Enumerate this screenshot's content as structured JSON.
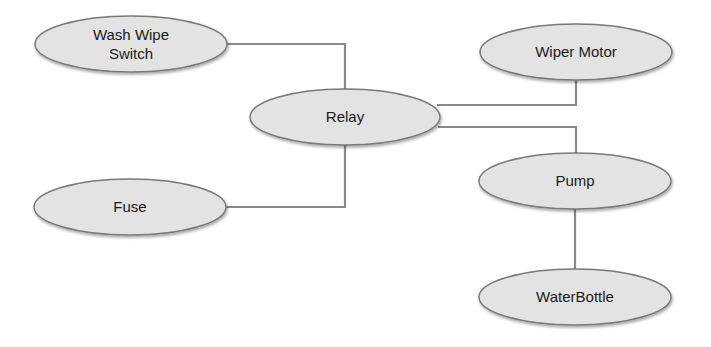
{
  "diagram": {
    "type": "block-diagram",
    "colors": {
      "node_fill": "#e3e3e3",
      "node_stroke": "#7a7a7a",
      "connector": "#8a8a8a",
      "text": "#1a1a1a",
      "background": "#ffffff"
    },
    "nodes": [
      {
        "id": "wash_wipe_switch",
        "lines": [
          "Wash Wipe",
          "Switch"
        ],
        "cx": 131,
        "cy": 44,
        "rx": 96,
        "ry": 28
      },
      {
        "id": "relay",
        "lines": [
          "Relay"
        ],
        "cx": 345,
        "cy": 117,
        "rx": 95,
        "ry": 28
      },
      {
        "id": "wiper_motor",
        "lines": [
          "Wiper Motor"
        ],
        "cx": 576,
        "cy": 52,
        "rx": 96,
        "ry": 28
      },
      {
        "id": "fuse",
        "lines": [
          "Fuse"
        ],
        "cx": 130,
        "cy": 207,
        "rx": 96,
        "ry": 28
      },
      {
        "id": "pump",
        "lines": [
          "Pump"
        ],
        "cx": 575,
        "cy": 181,
        "rx": 96,
        "ry": 28
      },
      {
        "id": "water_bottle",
        "lines": [
          "WaterBottle"
        ],
        "cx": 575,
        "cy": 297,
        "rx": 96,
        "ry": 28
      }
    ],
    "edges": [
      {
        "from": "wash_wipe_switch",
        "to": "relay",
        "points": [
          [
            227,
            44
          ],
          [
            345,
            44
          ],
          [
            345,
            89
          ]
        ]
      },
      {
        "from": "relay",
        "to": "wiper_motor",
        "points": [
          [
            437,
            105
          ],
          [
            576,
            105
          ],
          [
            576,
            80
          ]
        ]
      },
      {
        "from": "relay",
        "to": "pump",
        "points": [
          [
            438,
            127
          ],
          [
            576,
            127
          ],
          [
            576,
            153
          ]
        ]
      },
      {
        "from": "relay",
        "to": "fuse",
        "points": [
          [
            345,
            145
          ],
          [
            345,
            207
          ],
          [
            226,
            207
          ]
        ]
      },
      {
        "from": "pump",
        "to": "water_bottle",
        "points": [
          [
            575,
            209
          ],
          [
            575,
            269
          ]
        ]
      }
    ]
  }
}
